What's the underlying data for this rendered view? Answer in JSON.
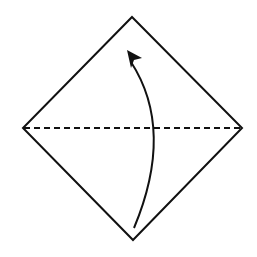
{
  "diagram": {
    "type": "origami-fold-step",
    "colors": {
      "background": "#ffffff",
      "stroke": "#111111"
    },
    "paper": {
      "top": [
        132,
        17
      ],
      "right": [
        242,
        128
      ],
      "bottom": [
        133,
        240
      ],
      "left": [
        23,
        128
      ]
    },
    "fold_line": {
      "style": "dashed",
      "from": [
        23,
        128
      ],
      "to": [
        242,
        128
      ]
    },
    "arrow": {
      "from": [
        134,
        228
      ],
      "via": [
        158,
        128
      ],
      "to": [
        128,
        52
      ],
      "direction": "up"
    }
  }
}
